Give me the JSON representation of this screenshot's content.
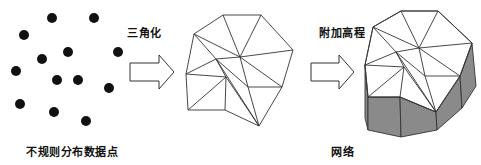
{
  "labels": {
    "points": "不规则分布数据点",
    "triangulate": "三角化",
    "elevate": "附加高程",
    "mesh": "网络"
  },
  "colors": {
    "dot": "#111111",
    "line": "#333333",
    "side_fill": "#8a8a8a",
    "top_fill": "#ffffff"
  },
  "scatter_points": [
    [
      52,
      18
    ],
    [
      94,
      18
    ],
    [
      24,
      35
    ],
    [
      42,
      59
    ],
    [
      68,
      52
    ],
    [
      118,
      52
    ],
    [
      16,
      71
    ],
    [
      57,
      80
    ],
    [
      78,
      80
    ],
    [
      109,
      88
    ],
    [
      20,
      104
    ],
    [
      54,
      112
    ],
    [
      86,
      121
    ]
  ],
  "triangulation": {
    "vertices": {
      "A": [
        223,
        15
      ],
      "B": [
        261,
        15
      ],
      "C": [
        293,
        50
      ],
      "D": [
        194,
        34
      ],
      "E": [
        216,
        59
      ],
      "F": [
        240,
        57
      ],
      "G": [
        186,
        74
      ],
      "H": [
        226,
        77
      ],
      "I": [
        248,
        87
      ],
      "J": [
        282,
        87
      ],
      "K": [
        188,
        110
      ],
      "L": [
        225,
        110
      ],
      "M": [
        259,
        126
      ]
    },
    "edges": [
      [
        "A",
        "B"
      ],
      [
        "B",
        "C"
      ],
      [
        "A",
        "D"
      ],
      [
        "D",
        "G"
      ],
      [
        "G",
        "K"
      ],
      [
        "K",
        "L"
      ],
      [
        "L",
        "M"
      ],
      [
        "M",
        "J"
      ],
      [
        "J",
        "C"
      ],
      [
        "A",
        "F"
      ],
      [
        "B",
        "F"
      ],
      [
        "C",
        "F"
      ],
      [
        "D",
        "F"
      ],
      [
        "D",
        "E"
      ],
      [
        "E",
        "F"
      ],
      [
        "E",
        "G"
      ],
      [
        "E",
        "H"
      ],
      [
        "G",
        "H"
      ],
      [
        "H",
        "K"
      ],
      [
        "H",
        "L"
      ],
      [
        "H",
        "M"
      ],
      [
        "E",
        "I"
      ],
      [
        "F",
        "I"
      ],
      [
        "I",
        "J"
      ],
      [
        "I",
        "M"
      ],
      [
        "F",
        "J"
      ],
      [
        "E",
        "M"
      ]
    ]
  },
  "mesh": {
    "vertices": {
      "a": [
        401,
        11
      ],
      "b": [
        438,
        11
      ],
      "c": [
        472,
        43
      ],
      "d": [
        373,
        27
      ],
      "e": [
        396,
        52
      ],
      "f": [
        419,
        48
      ],
      "g": [
        365,
        65
      ],
      "h": [
        404,
        67
      ],
      "i": [
        425,
        76
      ],
      "j": [
        460,
        76
      ],
      "k": [
        368,
        97
      ],
      "l": [
        400,
        97
      ],
      "m": [
        436,
        112
      ]
    },
    "bottom": {
      "g": [
        365,
        118
      ],
      "k": [
        368,
        130
      ],
      "l": [
        401,
        137
      ],
      "m": [
        437,
        130
      ],
      "j": [
        462,
        108
      ],
      "c": [
        476,
        86
      ]
    }
  }
}
